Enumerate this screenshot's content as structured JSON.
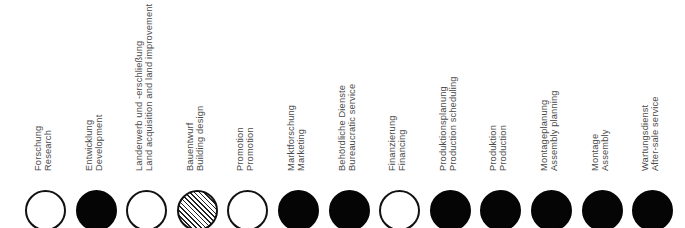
{
  "diagram": {
    "colors": {
      "filled": "#050505",
      "outline": "#111111",
      "text": "#4a4a4a"
    },
    "legend_states": [
      "open",
      "filled",
      "hatched"
    ],
    "items": [
      {
        "de": "Forschung",
        "en": "Research",
        "state": "open"
      },
      {
        "de": "Entwicklung",
        "en": "Development",
        "state": "filled"
      },
      {
        "de": "Landerwerb und -erschließung",
        "en": "Land acquisition and land improvement",
        "state": "open"
      },
      {
        "de": "Bauentwurf",
        "en": "Building design",
        "state": "hatched"
      },
      {
        "de": "Promotion",
        "en": "Promotion",
        "state": "open"
      },
      {
        "de": "Marktforschung",
        "en": "Marketing",
        "state": "filled"
      },
      {
        "de": "Behördliche Dienste",
        "en": "Bureaucratic service",
        "state": "filled"
      },
      {
        "de": "Finanzierung",
        "en": "Financing",
        "state": "open"
      },
      {
        "de": "Produktionsplanung",
        "en": "Production scheduling",
        "state": "filled"
      },
      {
        "de": "Produktion",
        "en": "Production",
        "state": "filled"
      },
      {
        "de": "Montageplanung",
        "en": "Assembly planning",
        "state": "filled"
      },
      {
        "de": "Montage",
        "en": "Assembly",
        "state": "filled"
      },
      {
        "de": "Wartungsdienst",
        "en": "After-sale service",
        "state": "filled"
      }
    ]
  }
}
